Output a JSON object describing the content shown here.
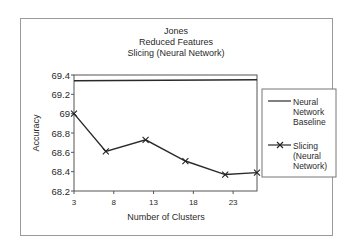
{
  "chart_data": {
    "type": "line",
    "title": [
      "Jones",
      "Reduced Features",
      "Slicing (Neural Network)"
    ],
    "xlabel": "Number of Clusters",
    "ylabel": "Accuracy",
    "xlim": [
      3,
      26
    ],
    "ylim": [
      68.2,
      69.4
    ],
    "xticks": [
      3,
      8,
      13,
      18,
      23
    ],
    "xtick_labels": [
      "3",
      "8",
      "13",
      "18",
      "23"
    ],
    "yticks": [
      68.2,
      68.4,
      68.6,
      68.8,
      69,
      69.2,
      69.4
    ],
    "ytick_labels": [
      "68.2",
      "68.4",
      "68.6",
      "68.8",
      "69",
      "69.2",
      "69.4"
    ],
    "grid": false,
    "legend_position": "right",
    "series": [
      {
        "name": "Neural Network Baseline",
        "legend_lines": [
          "Neural",
          "Network",
          "Baseline"
        ],
        "marker": "none",
        "x": [
          3,
          26
        ],
        "values": [
          69.34,
          69.35
        ]
      },
      {
        "name": "Slicing (Neural Network)",
        "legend_lines": [
          "Slicing",
          "(Neural",
          "Network)"
        ],
        "marker": "x",
        "x": [
          3,
          7,
          12,
          17,
          22,
          26
        ],
        "values": [
          69.0,
          68.61,
          68.73,
          68.51,
          68.37,
          68.39
        ]
      }
    ]
  }
}
